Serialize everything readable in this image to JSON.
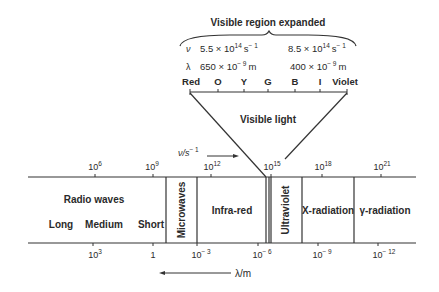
{
  "visible_expanded": {
    "heading": "Visible region expanded",
    "nu_symbol": "ν",
    "lambda_symbol": "λ",
    "nu_red": "5.5 × 10",
    "nu_red_exp": "14",
    "nu_red_unit": "s",
    "nu_red_unit_exp": "− 1",
    "nu_violet": "8.5 × 10",
    "nu_violet_exp": "14",
    "nu_violet_unit": "s",
    "nu_violet_unit_exp": "− 1",
    "lambda_red": "650 × 10",
    "lambda_red_exp": "− 9",
    "lambda_red_unit": "m",
    "lambda_violet": "400 × 10",
    "lambda_violet_exp": "− 9",
    "lambda_violet_unit": "m",
    "colors": [
      "Red",
      "O",
      "Y",
      "G",
      "B",
      "I",
      "Violet"
    ],
    "label": "Visible light"
  },
  "frequency_axis": {
    "label": "ν/s",
    "label_exp": "− 1",
    "ticks": [
      {
        "base": "10",
        "exp": "6"
      },
      {
        "base": "10",
        "exp": "9"
      },
      {
        "base": "10",
        "exp": "12"
      },
      {
        "base": "10",
        "exp": "15"
      },
      {
        "base": "10",
        "exp": "18"
      },
      {
        "base": "10",
        "exp": "21"
      }
    ]
  },
  "wavelength_axis": {
    "label": "λ/m",
    "ticks": [
      {
        "base": "10",
        "exp": "3"
      },
      {
        "base": "1",
        "exp": ""
      },
      {
        "base": "10",
        "exp": "− 3"
      },
      {
        "base": "10",
        "exp": "− 6"
      },
      {
        "base": "10",
        "exp": "− 9"
      },
      {
        "base": "10",
        "exp": "− 12"
      }
    ]
  },
  "regions": {
    "radio": "Radio waves",
    "radio_sub": [
      "Long",
      "Medium",
      "Short"
    ],
    "microwaves": "Microwaves",
    "infrared": "Infra-red",
    "ultraviolet": "Ultraviolet",
    "xray": "X-radiation",
    "gamma": "γ-radiation"
  }
}
